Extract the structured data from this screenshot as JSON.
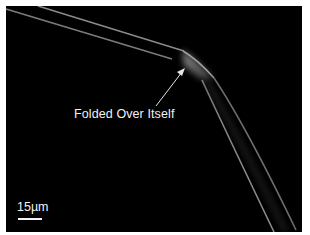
{
  "image": {
    "description": "Micrograph of a thin fiber folded over itself on a black background",
    "background_color": "#000000",
    "border_color": "#ffffff"
  },
  "annotation": {
    "label": "Folded Over Itself",
    "arrow_color": "#e6e6e6"
  },
  "scale_bar": {
    "label": "15µm"
  }
}
